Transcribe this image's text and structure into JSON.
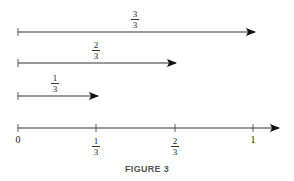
{
  "figure": {
    "caption": "FIGURE 3",
    "arrows": [
      {
        "label_num": "3",
        "label_den": "3",
        "length_fraction": 1
      },
      {
        "label_num": "2",
        "label_den": "3",
        "length_fraction": 0.6667
      },
      {
        "label_num": "1",
        "label_den": "3",
        "length_fraction": 0.3333
      }
    ],
    "number_line": {
      "ticks": [
        {
          "value": 0,
          "label": "0"
        },
        {
          "value": 0.3333,
          "label_num": "1",
          "label_den": "3"
        },
        {
          "value": 0.6667,
          "label_num": "2",
          "label_den": "3"
        },
        {
          "value": 1,
          "label": "1"
        }
      ]
    }
  }
}
